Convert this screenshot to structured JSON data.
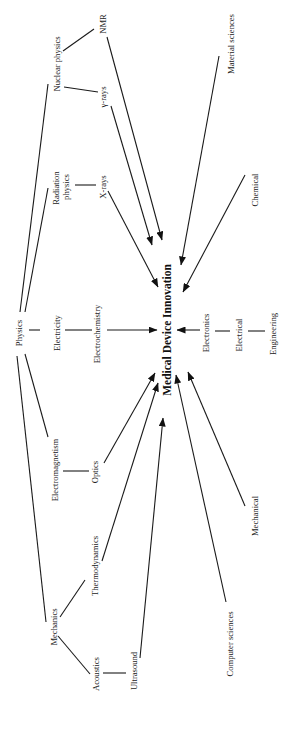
{
  "diagram": {
    "title": "Medical Device Innovation",
    "orientation": "rotated-90-ccw",
    "center": {
      "id": "mdi",
      "label": "Medical Device Innovation",
      "x": 167,
      "y": 318
    },
    "nodes": [
      {
        "id": "physics",
        "label": "Physics",
        "x": 19,
        "y": 331
      },
      {
        "id": "nuclear",
        "label": "Nuclear physics",
        "x": 58,
        "y": 62
      },
      {
        "id": "nmr",
        "label": "NMR",
        "x": 103,
        "y": 22
      },
      {
        "id": "gamma",
        "label": "γ-rays",
        "x": 103,
        "y": 95
      },
      {
        "id": "radiation",
        "label": "Radiation physics",
        "x": 66,
        "y": 186
      },
      {
        "id": "xrays",
        "label": "X-rays",
        "x": 103,
        "y": 188
      },
      {
        "id": "electricity",
        "label": "Electricity",
        "x": 57,
        "y": 331
      },
      {
        "id": "electrochem",
        "label": "Electrochemistry",
        "x": 98,
        "y": 332
      },
      {
        "id": "electromag",
        "label": "Electromagnetism",
        "x": 56,
        "y": 468
      },
      {
        "id": "optics",
        "label": "Optics",
        "x": 96,
        "y": 473
      },
      {
        "id": "thermo",
        "label": "Thermodynamics",
        "x": 96,
        "y": 562
      },
      {
        "id": "mechanics",
        "label": "Mechanics",
        "x": 55,
        "y": 626
      },
      {
        "id": "acoustics",
        "label": "Acoustics",
        "x": 97,
        "y": 678
      },
      {
        "id": "ultrasound",
        "label": "Ultrasound",
        "x": 135,
        "y": 678
      },
      {
        "id": "materials",
        "label": "Material sciences",
        "x": 261,
        "y": 42
      },
      {
        "id": "chemical",
        "label": "Chemical",
        "x": 258,
        "y": 190
      },
      {
        "id": "electronics",
        "label": "Electronics",
        "x": 207,
        "y": 328
      },
      {
        "id": "electrical",
        "label": "Electrical",
        "x": 241,
        "y": 332
      },
      {
        "id": "engineering",
        "label": "Engineering",
        "x": 275,
        "y": 333
      },
      {
        "id": "mechanical",
        "label": "Mechanical",
        "x": 256,
        "y": 513
      },
      {
        "id": "compsci",
        "label": "Computer sciences",
        "x": 232,
        "y": 642
      }
    ],
    "links": [
      {
        "from": "physics",
        "to": "nuclear",
        "arrow": false
      },
      {
        "from": "physics",
        "to": "radiation",
        "arrow": false
      },
      {
        "from": "physics",
        "to": "electricity",
        "arrow": false
      },
      {
        "from": "physics",
        "to": "electromag",
        "arrow": false
      },
      {
        "from": "physics",
        "to": "mechanics",
        "arrow": false
      },
      {
        "from": "nuclear",
        "to": "nmr",
        "arrow": false
      },
      {
        "from": "nuclear",
        "to": "gamma",
        "arrow": false
      },
      {
        "from": "radiation",
        "to": "xrays",
        "arrow": false
      },
      {
        "from": "electricity",
        "to": "electrochem",
        "arrow": false
      },
      {
        "from": "electromag",
        "to": "optics",
        "arrow": false
      },
      {
        "from": "mechanics",
        "to": "thermo",
        "arrow": false
      },
      {
        "from": "mechanics",
        "to": "acoustics",
        "arrow": false
      },
      {
        "from": "acoustics",
        "to": "ultrasound",
        "arrow": false
      },
      {
        "from": "electronics",
        "to": "electrical",
        "arrow": false
      },
      {
        "from": "electrical",
        "to": "engineering",
        "arrow": false
      },
      {
        "from": "nmr",
        "to": "mdi",
        "arrow": true
      },
      {
        "from": "gamma",
        "to": "mdi",
        "arrow": true
      },
      {
        "from": "xrays",
        "to": "mdi",
        "arrow": true
      },
      {
        "from": "electrochem",
        "to": "mdi",
        "arrow": true
      },
      {
        "from": "optics",
        "to": "mdi",
        "arrow": true
      },
      {
        "from": "thermo",
        "to": "mdi",
        "arrow": true
      },
      {
        "from": "ultrasound",
        "to": "mdi",
        "arrow": true
      },
      {
        "from": "materials",
        "to": "mdi",
        "arrow": true
      },
      {
        "from": "chemical",
        "to": "mdi",
        "arrow": true
      },
      {
        "from": "electronics",
        "to": "mdi",
        "arrow": true
      },
      {
        "from": "mechanical",
        "to": "mdi",
        "arrow": true
      },
      {
        "from": "compsci",
        "to": "mdi",
        "arrow": true
      }
    ]
  }
}
